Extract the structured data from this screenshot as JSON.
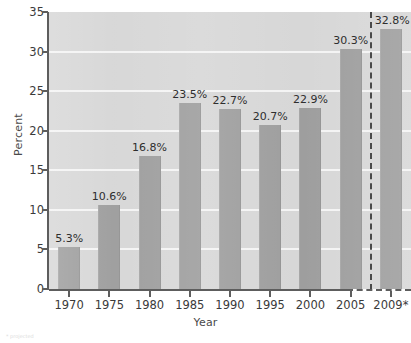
{
  "chart_data": {
    "type": "bar",
    "title": "",
    "xlabel": "Year",
    "ylabel": "Percent",
    "categories": [
      "1970",
      "1975",
      "1980",
      "1985",
      "1990",
      "1995",
      "2000",
      "2005",
      "2009*"
    ],
    "values": [
      5.3,
      10.6,
      16.8,
      23.5,
      22.7,
      20.7,
      22.9,
      30.3,
      32.8
    ],
    "data_labels": [
      "5.3%",
      "10.6%",
      "16.8%",
      "23.5%",
      "22.7%",
      "20.7%",
      "22.9%",
      "30.3%",
      "32.8%"
    ],
    "ylim": [
      0,
      35
    ],
    "y_ticks": [
      0,
      5,
      10,
      15,
      20,
      25,
      30,
      35
    ],
    "y_tick_labels": [
      "0",
      "5",
      "10",
      "15",
      "20",
      "25",
      "30",
      "35"
    ],
    "grid": true,
    "legend": "none",
    "annotations": [
      {
        "name": "forecast-divider",
        "type": "vertical-dashed-line",
        "between": [
          "2005",
          "2009*"
        ]
      }
    ],
    "colors": {
      "bar": "#9e9e9e",
      "plot_background": "#d7d7d7",
      "gridline": "#f4f4f4",
      "axis": "#5d5d5d",
      "text": "#3a3a3a"
    }
  },
  "footnote": {
    "text": "* projected"
  }
}
